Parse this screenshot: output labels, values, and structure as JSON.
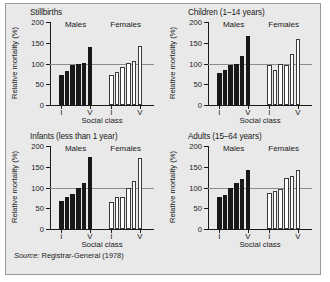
{
  "figure": {
    "source_prefix": "Source:",
    "source_text": " Registrar-General (1978)",
    "background_color": "#e9e9e9",
    "male_bar_color": "#181818",
    "female_bar_color": "#ffffff",
    "reference_line_color": "#8d8d8d"
  },
  "chart_data": [
    {
      "type": "bar",
      "title": "Stillbirths",
      "xlabel": "Social class",
      "ylabel": "Relative mortality (%)",
      "ylim": [
        0,
        200
      ],
      "yticks": [
        0,
        50,
        100,
        150,
        200
      ],
      "ytick_labels": [
        "0",
        "50",
        "100",
        "150",
        "200"
      ],
      "grid": false,
      "reference_line": 100,
      "categories": [
        "I",
        "II",
        "IIIN",
        "IIIM",
        "IV",
        "V"
      ],
      "xtick_labels": [
        "I",
        "V"
      ],
      "legend_position": "inside-top",
      "series": [
        {
          "name": "Males",
          "values": [
            73,
            83,
            96,
            99,
            101,
            140
          ]
        },
        {
          "name": "Females",
          "values": [
            72,
            79,
            92,
            101,
            107,
            142
          ]
        }
      ]
    },
    {
      "type": "bar",
      "title": "Children (1–14 years)",
      "xlabel": "Social class",
      "ylabel": "Relative mortality (%)",
      "ylim": [
        0,
        200
      ],
      "yticks": [
        0,
        50,
        100,
        150,
        200
      ],
      "ytick_labels": [
        "0",
        "50",
        "100",
        "150",
        "200"
      ],
      "grid": false,
      "reference_line": 100,
      "categories": [
        "I",
        "II",
        "IIIN",
        "IIIM",
        "IV",
        "V"
      ],
      "xtick_labels": [
        "I",
        "V"
      ],
      "legend_position": "inside-top",
      "series": [
        {
          "name": "Males",
          "values": [
            78,
            84,
            96,
            99,
            117,
            166
          ]
        },
        {
          "name": "Females",
          "values": [
            96,
            85,
            100,
            96,
            123,
            160
          ]
        }
      ]
    },
    {
      "type": "bar",
      "title": "Infants (less than 1 year)",
      "xlabel": "Social class",
      "ylabel": "Relative mortality (%)",
      "ylim": [
        0,
        200
      ],
      "yticks": [
        0,
        50,
        100,
        150,
        200
      ],
      "ytick_labels": [
        "0",
        "50",
        "100",
        "150",
        "200"
      ],
      "grid": false,
      "reference_line": 100,
      "categories": [
        "I",
        "II",
        "IIIN",
        "IIIM",
        "IV",
        "V"
      ],
      "xtick_labels": [
        "I",
        "V"
      ],
      "legend_position": "inside-top",
      "series": [
        {
          "name": "Males",
          "values": [
            68,
            77,
            85,
            99,
            110,
            174
          ]
        },
        {
          "name": "Females",
          "values": [
            64,
            77,
            77,
            98,
            115,
            172
          ]
        }
      ]
    },
    {
      "type": "bar",
      "title": "Adults (15–64 years)",
      "xlabel": "Social class",
      "ylabel": "Relative mortality (%)",
      "ylim": [
        0,
        200
      ],
      "yticks": [
        0,
        50,
        100,
        150,
        200
      ],
      "ytick_labels": [
        "0",
        "50",
        "100",
        "150",
        "200"
      ],
      "grid": false,
      "reference_line": 100,
      "categories": [
        "I",
        "II",
        "IIIN",
        "IIIM",
        "IV",
        "V"
      ],
      "xtick_labels": [
        "I",
        "V"
      ],
      "legend_position": "inside-top",
      "series": [
        {
          "name": "Males",
          "values": [
            77,
            83,
            100,
            111,
            120,
            143
          ]
        },
        {
          "name": "Females",
          "values": [
            86,
            91,
            97,
            122,
            127,
            142
          ]
        }
      ]
    }
  ]
}
